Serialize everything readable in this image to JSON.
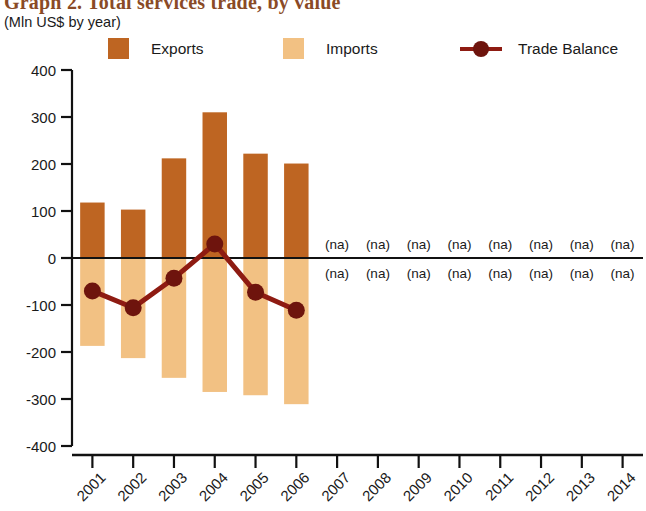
{
  "header": {
    "title": "Graph 2. Total services trade, by value",
    "subtitle": "(Mln US$ by year)"
  },
  "legend": {
    "exports_label": "Exports",
    "imports_label": "Imports",
    "balance_label": "Trade Balance"
  },
  "colors": {
    "exports": "#BE6522",
    "imports": "#F2C183",
    "balance": "#8E1B12",
    "axis": "#111111",
    "title": "#8A4A26"
  },
  "chart_data": {
    "type": "bar",
    "title": "Graph 2. Total services trade, by value",
    "subtitle": "(Mln US$ by year)",
    "xlabel": "",
    "ylabel": "Mln US$",
    "ylim": [
      -400,
      400
    ],
    "ytick_labels": [
      "400",
      "300",
      "200",
      "100",
      "0",
      "-100",
      "-200",
      "-300",
      "-400"
    ],
    "ytick_values": [
      400,
      300,
      200,
      100,
      0,
      -100,
      -200,
      -300,
      -400
    ],
    "grid": false,
    "legend_position": "top",
    "categories": [
      "2001",
      "2002",
      "2003",
      "2004",
      "2005",
      "2006",
      "2007",
      "2008",
      "2009",
      "2010",
      "2011",
      "2012",
      "2013",
      "2014"
    ],
    "na_text": "(na)",
    "na_years": [
      "2007",
      "2008",
      "2009",
      "2010",
      "2011",
      "2012",
      "2013",
      "2014"
    ],
    "series": [
      {
        "name": "Exports",
        "type": "bar",
        "values": [
          118,
          103,
          212,
          310,
          222,
          201,
          null,
          null,
          null,
          null,
          null,
          null,
          null,
          null
        ]
      },
      {
        "name": "Imports",
        "type": "bar",
        "values": [
          -187,
          -213,
          -255,
          -285,
          -292,
          -311,
          null,
          null,
          null,
          null,
          null,
          null,
          null,
          null
        ]
      },
      {
        "name": "Trade Balance",
        "type": "line",
        "values": [
          -70,
          -106,
          -43,
          30,
          -73,
          -111,
          null,
          null,
          null,
          null,
          null,
          null,
          null,
          null
        ]
      }
    ]
  }
}
